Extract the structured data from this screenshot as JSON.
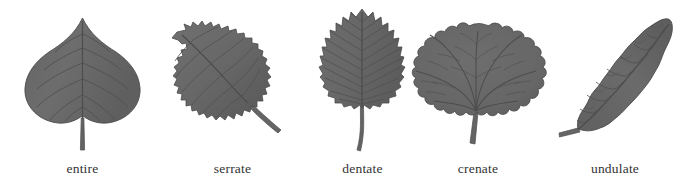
{
  "figure": {
    "width": 690,
    "height": 189,
    "background": "#ffffff",
    "label_color": "#333333",
    "leaf_fill": "#6a6a6a",
    "leaf_fill_light": "#767676",
    "leaf_fill_dark": "#5d5d5d",
    "leaf_outline": "#4a4a4a",
    "vein_color": "#4e4e4e",
    "petiole_color": "#626262"
  },
  "diagram": {
    "label_row_y": 168
  },
  "leaves": [
    {
      "id": "entire",
      "label": "entire",
      "margin_type": "entire",
      "shape": "cordate",
      "venation": "pinnate",
      "description": "Heart-shaped leaf with a smooth, unbroken margin",
      "label_x": 82,
      "cell_left": 0,
      "cell_width": 165
    },
    {
      "id": "serrate",
      "label": "serrate",
      "margin_type": "serrate",
      "shape": "ovate-rounded",
      "venation": "pinnate",
      "description": "Margin with fine forward-pointing saw-like teeth",
      "label_x": 230,
      "cell_left": 160,
      "cell_width": 145
    },
    {
      "id": "dentate",
      "label": "dentate",
      "margin_type": "dentate",
      "shape": "ovate",
      "venation": "pinnate",
      "description": "Margin with sharp outward-pointing triangular teeth",
      "label_x": 362,
      "cell_left": 300,
      "cell_width": 125
    },
    {
      "id": "crenate",
      "label": "crenate",
      "margin_type": "crenate",
      "shape": "orbicular",
      "venation": "palmate",
      "description": "Margin with rounded scalloped lobes",
      "label_x": 476,
      "cell_left": 408,
      "cell_width": 140
    },
    {
      "id": "undulate",
      "label": "undulate",
      "margin_type": "undulate",
      "shape": "elliptic",
      "venation": "pinnate",
      "description": "Margin wavy in the vertical plane",
      "label_x": 604,
      "cell_width": 150,
      "cell_left": 540
    }
  ]
}
